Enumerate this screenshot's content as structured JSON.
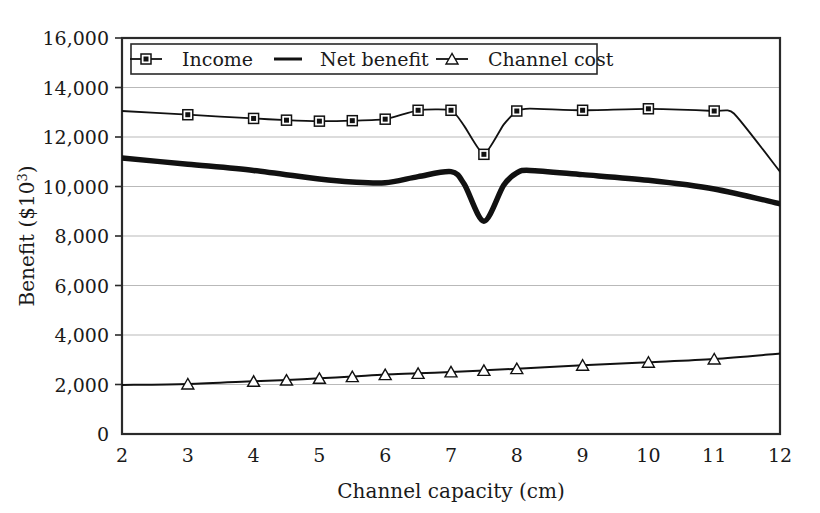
{
  "chart_data": {
    "type": "line",
    "title": "",
    "xlabel": "Channel capacity (cm)",
    "ylabel": "Benefit ($10",
    "ylabel_sup": "3",
    "ylabel_suffix": ")",
    "xlim": [
      2,
      12
    ],
    "ylim": [
      0,
      16000
    ],
    "grid": true,
    "legend_position": "top-inside",
    "xticks": [
      "2",
      "3",
      "4",
      "5",
      "6",
      "7",
      "8",
      "9",
      "10",
      "11",
      "12"
    ],
    "xtick_values": [
      2,
      3,
      4,
      5,
      6,
      7,
      8,
      9,
      10,
      11,
      12
    ],
    "yticks": [
      "0",
      "2,000",
      "4,000",
      "6,000",
      "8,000",
      "10,000",
      "12,000",
      "14,000",
      "16,000"
    ],
    "ytick_values": [
      0,
      2000,
      4000,
      6000,
      8000,
      10000,
      12000,
      14000,
      16000
    ],
    "series": [
      {
        "name": "Income",
        "marker": "square",
        "line_width": 1.8,
        "color": "#111111",
        "x": [
          2,
          3,
          4,
          4.5,
          5,
          5.5,
          6,
          6.5,
          7,
          7.2,
          7.5,
          7.8,
          8,
          8.2,
          9,
          10,
          11,
          11.3,
          12
        ],
        "y": [
          13050,
          12900,
          12750,
          12680,
          12640,
          12660,
          12720,
          13080,
          13080,
          12450,
          11300,
          12500,
          13050,
          13150,
          13080,
          13140,
          13050,
          12950,
          10600
        ],
        "marker_x": [
          3,
          4,
          4.5,
          5,
          5.5,
          6,
          6.5,
          7,
          7.5,
          8,
          9,
          10,
          11
        ],
        "marker_y": [
          12900,
          12750,
          12680,
          12640,
          12660,
          12720,
          13080,
          13080,
          11300,
          13050,
          13080,
          13140,
          13050
        ]
      },
      {
        "name": "Net benefit",
        "marker": "none",
        "line_width": 5.5,
        "color": "#111111",
        "x": [
          2,
          3,
          4,
          5,
          5.5,
          6,
          6.5,
          7,
          7.2,
          7.5,
          7.8,
          8,
          8.2,
          9,
          10,
          11,
          12
        ],
        "y": [
          11150,
          10900,
          10650,
          10300,
          10180,
          10150,
          10400,
          10600,
          10100,
          8600,
          10050,
          10550,
          10650,
          10480,
          10250,
          9900,
          9300
        ]
      },
      {
        "name": "Channel cost",
        "marker": "triangle",
        "line_width": 2.0,
        "color": "#111111",
        "x": [
          2,
          3,
          4,
          4.5,
          5,
          5.5,
          6,
          6.5,
          7,
          7.5,
          8,
          9,
          10,
          11,
          12
        ],
        "y": [
          1980,
          2020,
          2130,
          2180,
          2250,
          2320,
          2400,
          2450,
          2510,
          2570,
          2640,
          2780,
          2900,
          3030,
          3250
        ],
        "marker_x": [
          3,
          4,
          4.5,
          5,
          5.5,
          6,
          6.5,
          7,
          7.5,
          8,
          9,
          10,
          11
        ],
        "marker_y": [
          2020,
          2130,
          2180,
          2250,
          2320,
          2400,
          2450,
          2510,
          2570,
          2640,
          2780,
          2900,
          3030
        ]
      }
    ]
  },
  "legend": {
    "items": [
      {
        "label": "Income",
        "marker": "square"
      },
      {
        "label": "Net benefit",
        "marker": "none"
      },
      {
        "label": "Channel cost",
        "marker": "triangle"
      }
    ]
  }
}
